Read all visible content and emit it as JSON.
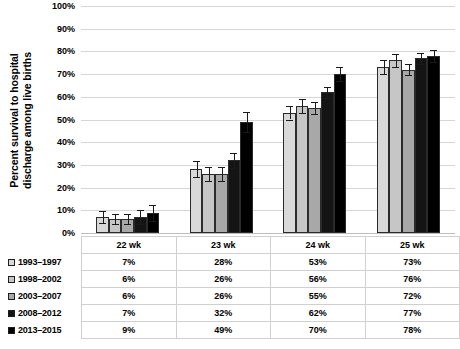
{
  "chart_data": {
    "type": "bar",
    "title": "",
    "subtitle": "",
    "xlabel": "",
    "ylabel": "Percent survival to hospital discharge among live births",
    "ylabel_line1": "Percent survival to hospital",
    "ylabel_line2": "discharge among live births",
    "ylim": [
      0,
      100
    ],
    "y_tick_labels": [
      "100%",
      "90%",
      "80%",
      "70%",
      "60%",
      "50%",
      "40%",
      "30%",
      "20%",
      "10%",
      "0%"
    ],
    "y_tick_values": [
      100,
      90,
      80,
      70,
      60,
      50,
      40,
      30,
      20,
      10,
      0
    ],
    "grid": "horizontal",
    "legend_position": "bottom-table",
    "categories": [
      "22 wk",
      "23 wk",
      "24 wk",
      "25 wk"
    ],
    "series": [
      {
        "name": "1993–1997",
        "color": "#d9d9d9",
        "values": [
          7,
          28,
          53,
          73
        ],
        "labels": [
          "7%",
          "28%",
          "53%",
          "73%"
        ],
        "errors": [
          2.5,
          3.5,
          3.0,
          3.0
        ]
      },
      {
        "name": "1998–2002",
        "color": "#c6c6c6",
        "values": [
          6,
          26,
          56,
          76
        ],
        "labels": [
          "6%",
          "26%",
          "56%",
          "76%"
        ],
        "errors": [
          2.2,
          3.2,
          3.0,
          3.0
        ]
      },
      {
        "name": "2003–2007",
        "color": "#a8a8a8",
        "values": [
          6,
          26,
          55,
          72
        ],
        "labels": [
          "6%",
          "26%",
          "55%",
          "72%"
        ],
        "errors": [
          2.2,
          3.2,
          2.5,
          2.5
        ]
      },
      {
        "name": "2008–2012",
        "color": "#141414",
        "values": [
          7,
          32,
          62,
          77
        ],
        "labels": [
          "7%",
          "32%",
          "62%",
          "77%"
        ],
        "errors": [
          3.0,
          3.2,
          2.5,
          2.5
        ]
      },
      {
        "name": "2013–2015",
        "color": "#000000",
        "values": [
          9,
          49,
          70,
          78
        ],
        "labels": [
          "9%",
          "49%",
          "70%",
          "78%"
        ],
        "errors": [
          3.5,
          4.5,
          3.0,
          2.5
        ]
      }
    ]
  },
  "table": {
    "column_headers": [
      "22 wk",
      "23 wk",
      "24 wk",
      "25 wk"
    ],
    "rows": [
      {
        "label": "1993–1997",
        "swatch": "#d9d9d9",
        "cells": [
          "7%",
          "28%",
          "53%",
          "73%"
        ]
      },
      {
        "label": "1998–2002",
        "swatch": "#c6c6c6",
        "cells": [
          "6%",
          "26%",
          "56%",
          "76%"
        ]
      },
      {
        "label": "2003–2007",
        "swatch": "#a8a8a8",
        "cells": [
          "6%",
          "26%",
          "55%",
          "72%"
        ]
      },
      {
        "label": "2008–2012",
        "swatch": "#141414",
        "cells": [
          "7%",
          "32%",
          "62%",
          "77%"
        ]
      },
      {
        "label": "2013–2015",
        "swatch": "#000000",
        "cells": [
          "9%",
          "49%",
          "70%",
          "78%"
        ]
      }
    ]
  },
  "colors": {
    "gridline": "#d6d6d6",
    "bar_outline": "#2b2b2b",
    "error_bar": "#1a1a1a",
    "table_border": "#d0d0d0",
    "text": "#000000",
    "background": "#ffffff"
  }
}
